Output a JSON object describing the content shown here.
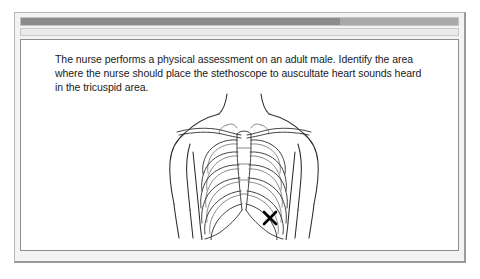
{
  "window": {
    "title_bar": {
      "name": "title-bar",
      "fill_percent": 73,
      "fill_color": "#8b8b8b",
      "track_color": "#a9a9a9"
    },
    "tool_bar": {
      "name": "tool-bar",
      "color": "#eaeaea"
    },
    "frame_color": "#f3f3f3"
  },
  "content": {
    "question": "The nurse performs a physical assessment on an adult male. Identify the area where the nurse should place the stethoscope to auscultate heart sounds heard in the tricuspid area.",
    "illustration": {
      "name": "anterior-thorax-ribcage-diagram",
      "description": "Anterior view of an adult male torso showing neck, shoulders, arms, clavicles, sternum and rib cage",
      "marker": {
        "name": "tricuspid-area-marker",
        "glyph": "X",
        "color": "#000000",
        "location_label": "lower left sternal border",
        "x": 121,
        "y": 126
      },
      "line_color": "#2b2b2b",
      "background": "#ffffff"
    }
  }
}
